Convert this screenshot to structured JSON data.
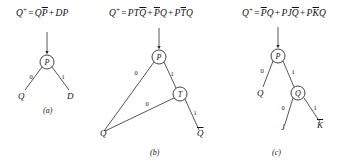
{
  "figure": {
    "background": "#ffffff",
    "ink_color": "#2b2b2b",
    "panel_count": 3
  },
  "panels": [
    {
      "id": "a",
      "caption": "(a)",
      "equation": {
        "lhs": "Q",
        "lhs_superscript": "+",
        "equals": "=",
        "terms": [
          {
            "text": "QP",
            "overline_part": "P",
            "plain_part": "Q"
          },
          {
            "text": "DP",
            "overline_part": "",
            "plain_part": "DP"
          }
        ],
        "full_text": "Q+ = QP̅ + DP"
      },
      "nodes": [
        {
          "name": "P",
          "label": "P",
          "type": "decision"
        }
      ],
      "leaves": [
        {
          "label": "Q",
          "overline": false,
          "branch": "0"
        },
        {
          "label": "D",
          "overline": false,
          "branch": "1"
        }
      ],
      "edge_labels": [
        "0",
        "1"
      ],
      "has_input_arrow": true
    },
    {
      "id": "b",
      "caption": "(b)",
      "equation": {
        "lhs": "Q",
        "lhs_superscript": "+",
        "equals": "=",
        "terms": [
          {
            "text": "PTQ",
            "overline_part": "Q",
            "plain_part": "PT"
          },
          {
            "text": "PQ",
            "overline_part": "P",
            "plain_part": "Q"
          },
          {
            "text": "PTQ",
            "overline_part": "T",
            "plain_part": "P,Q"
          }
        ],
        "full_text": "Q+ = PTQ̅ + P̅Q + PT̅Q"
      },
      "nodes": [
        {
          "name": "P",
          "label": "P",
          "type": "decision"
        },
        {
          "name": "T",
          "label": "T",
          "type": "decision"
        }
      ],
      "leaves": [
        {
          "label": "Q",
          "overline": false,
          "branch": "0"
        },
        {
          "label": "Q",
          "overline": true,
          "branch": "1"
        }
      ],
      "edge_labels": [
        "0",
        "1",
        "0",
        "1"
      ],
      "has_input_arrow": true
    },
    {
      "id": "c",
      "caption": "(c)",
      "equation": {
        "lhs": "Q",
        "lhs_superscript": "+",
        "equals": "=",
        "terms": [
          {
            "text": "PQ",
            "overline_part": "P",
            "plain_part": "Q"
          },
          {
            "text": "PJQ",
            "overline_part": "Q",
            "plain_part": "PJ"
          },
          {
            "text": "PKQ",
            "overline_part": "K",
            "plain_part": "P,Q"
          }
        ],
        "full_text": "Q+ = P̅Q + PJQ̅ + PK̅Q"
      },
      "nodes": [
        {
          "name": "P",
          "label": "P",
          "type": "decision"
        },
        {
          "name": "Q",
          "label": "Q",
          "type": "decision"
        }
      ],
      "leaves": [
        {
          "label": "Q",
          "overline": false,
          "branch": "0"
        },
        {
          "label": "J",
          "overline": false,
          "branch": "0"
        },
        {
          "label": "K",
          "overline": true,
          "branch": "1"
        }
      ],
      "edge_labels": [
        "0",
        "1",
        "0",
        "1"
      ],
      "has_input_arrow": true
    }
  ],
  "labels": {
    "zero": "0",
    "one": "1",
    "node_p": "P",
    "node_t": "T",
    "node_q": "Q",
    "leaf_q": "Q",
    "leaf_d": "D",
    "leaf_j": "J",
    "leaf_k": "K",
    "caption_a": "(a)",
    "caption_b": "(b)",
    "caption_c": "(c)"
  }
}
